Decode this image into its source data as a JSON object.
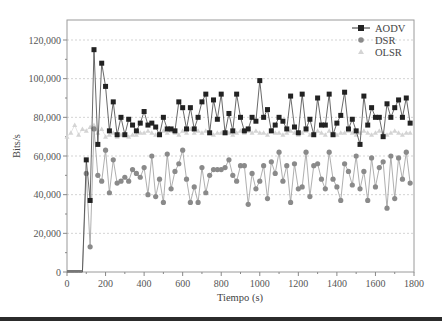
{
  "chart_data": {
    "type": "line",
    "title": "",
    "xlabel": "Tiempo (s)",
    "ylabel": "Bits/s",
    "xlim": [
      0,
      1800
    ],
    "ylim": [
      0,
      130000
    ],
    "x_ticks": [
      0,
      200,
      400,
      600,
      800,
      1000,
      1200,
      1400,
      1600,
      1800
    ],
    "x_tick_labels": [
      "0",
      "200",
      "400",
      "600",
      "800",
      "1000",
      "1200",
      "1400",
      "1600",
      "1800"
    ],
    "y_ticks": [
      0,
      20000,
      40000,
      60000,
      80000,
      100000,
      120000
    ],
    "y_tick_labels": [
      "0",
      "20,000",
      "40,000",
      "60,000",
      "80,000",
      "100,000",
      "120,000"
    ],
    "grid": "horizontal dashed",
    "legend_position": "upper right",
    "series": [
      {
        "name": "AODV",
        "marker": "square",
        "color": "#222222",
        "x": [
          0,
          20,
          40,
          60,
          80,
          100,
          120,
          140,
          160,
          180,
          200,
          220,
          240,
          260,
          280,
          300,
          320,
          340,
          360,
          380,
          400,
          420,
          440,
          460,
          480,
          500,
          520,
          540,
          560,
          580,
          600,
          620,
          640,
          660,
          680,
          700,
          720,
          740,
          760,
          780,
          800,
          820,
          840,
          860,
          880,
          900,
          920,
          940,
          960,
          980,
          1000,
          1020,
          1040,
          1060,
          1080,
          1100,
          1120,
          1140,
          1160,
          1180,
          1200,
          1220,
          1240,
          1260,
          1280,
          1300,
          1320,
          1340,
          1360,
          1380,
          1400,
          1420,
          1440,
          1460,
          1480,
          1500,
          1520,
          1540,
          1560,
          1580,
          1600,
          1620,
          1640,
          1660,
          1680,
          1700,
          1720,
          1740,
          1760,
          1780
        ],
        "values": [
          0,
          0,
          0,
          0,
          0,
          58000,
          37000,
          115000,
          66000,
          108000,
          96000,
          73000,
          88000,
          71000,
          80000,
          71000,
          79000,
          76000,
          73000,
          77000,
          83000,
          76000,
          77000,
          75000,
          71000,
          80000,
          74000,
          74000,
          73000,
          88000,
          85000,
          74000,
          85000,
          74000,
          80000,
          88000,
          92000,
          72000,
          89000,
          79000,
          92000,
          72000,
          82000,
          73000,
          92000,
          80000,
          73000,
          74000,
          80000,
          78000,
          99000,
          80000,
          84000,
          73000,
          76000,
          80000,
          78000,
          74000,
          91000,
          75000,
          72000,
          92000,
          74000,
          79000,
          71000,
          90000,
          76000,
          76000,
          92000,
          71000,
          77000,
          81000,
          93000,
          74000,
          79000,
          73000,
          66000,
          91000,
          76000,
          85000,
          80000,
          80000,
          70000,
          87000,
          80000,
          85000,
          89000,
          80000,
          90000,
          77000
        ]
      },
      {
        "name": "DSR",
        "marker": "circle",
        "color": "#8a8a8a",
        "x": [
          0,
          20,
          40,
          60,
          80,
          100,
          120,
          140,
          160,
          180,
          200,
          220,
          240,
          260,
          280,
          300,
          320,
          340,
          360,
          380,
          400,
          420,
          440,
          460,
          480,
          500,
          520,
          540,
          560,
          580,
          600,
          620,
          640,
          660,
          680,
          700,
          720,
          740,
          760,
          780,
          800,
          820,
          840,
          860,
          880,
          900,
          920,
          940,
          960,
          980,
          1000,
          1020,
          1040,
          1060,
          1080,
          1100,
          1120,
          1140,
          1160,
          1180,
          1200,
          1220,
          1240,
          1260,
          1280,
          1300,
          1320,
          1340,
          1360,
          1380,
          1400,
          1420,
          1440,
          1460,
          1480,
          1500,
          1520,
          1540,
          1560,
          1580,
          1600,
          1620,
          1640,
          1660,
          1680,
          1700,
          1720,
          1740,
          1760,
          1780
        ],
        "values": [
          0,
          0,
          0,
          0,
          0,
          51000,
          13000,
          74000,
          50000,
          47000,
          63000,
          41000,
          58000,
          46000,
          47000,
          49000,
          47000,
          53000,
          51000,
          49000,
          54000,
          40000,
          60000,
          39000,
          48000,
          36000,
          61000,
          43000,
          52000,
          56000,
          63000,
          48000,
          36000,
          44000,
          36000,
          54000,
          41000,
          50000,
          53000,
          53000,
          53000,
          54000,
          58000,
          50000,
          47000,
          55000,
          55000,
          35000,
          51000,
          43000,
          47000,
          55000,
          38000,
          57000,
          51000,
          62000,
          47000,
          55000,
          36000,
          56000,
          43000,
          44000,
          62000,
          39000,
          55000,
          56000,
          48000,
          43000,
          62000,
          48000,
          44000,
          37000,
          56000,
          52000,
          45000,
          60000,
          43000,
          52000,
          37000,
          59000,
          44000,
          54000,
          57000,
          33000,
          60000,
          38000,
          59000,
          48000,
          62000,
          46000
        ]
      },
      {
        "name": "OLSR",
        "marker": "triangle",
        "color": "#d4d4d4",
        "x": [
          0,
          20,
          40,
          60,
          80,
          100,
          120,
          140,
          160,
          180,
          200,
          220,
          240,
          260,
          280,
          300,
          320,
          340,
          360,
          380,
          400,
          420,
          440,
          460,
          480,
          500,
          520,
          540,
          560,
          580,
          600,
          620,
          640,
          660,
          680,
          700,
          720,
          740,
          760,
          780,
          800,
          820,
          840,
          860,
          880,
          900,
          920,
          940,
          960,
          980,
          1000,
          1020,
          1040,
          1060,
          1080,
          1100,
          1120,
          1140,
          1160,
          1180,
          1200,
          1220,
          1240,
          1260,
          1280,
          1300,
          1320,
          1340,
          1360,
          1380,
          1400,
          1420,
          1440,
          1460,
          1480,
          1500,
          1520,
          1540,
          1560,
          1580,
          1600,
          1620,
          1640,
          1660,
          1680,
          1700,
          1720,
          1740,
          1760,
          1780
        ],
        "values": [
          70000,
          72000,
          76000,
          71000,
          74000,
          73000,
          75000,
          76000,
          72000,
          74000,
          70000,
          71000,
          72000,
          70000,
          71000,
          72000,
          70000,
          71000,
          71000,
          72000,
          72000,
          73000,
          72000,
          71000,
          72000,
          73000,
          72000,
          73000,
          72000,
          71000,
          73000,
          72000,
          74000,
          72000,
          73000,
          72000,
          73000,
          72000,
          71000,
          72000,
          72000,
          73000,
          72000,
          71000,
          72000,
          73000,
          72000,
          73000,
          72000,
          73000,
          72000,
          72000,
          71000,
          73000,
          72000,
          72000,
          71000,
          72000,
          73000,
          72000,
          71000,
          72000,
          73000,
          71000,
          72000,
          73000,
          72000,
          71000,
          73000,
          72000,
          71000,
          72000,
          72000,
          73000,
          72000,
          71000,
          72000,
          73000,
          72000,
          71000,
          72000,
          73000,
          72000,
          71000,
          72000,
          73000,
          72000,
          71000,
          72000,
          72000
        ]
      }
    ]
  },
  "legend": {
    "items": [
      {
        "label": "AODV"
      },
      {
        "label": "DSR"
      },
      {
        "label": "OLSR"
      }
    ]
  },
  "axes": {
    "xlabel": "Tiempo (s)",
    "ylabel": "Bits/s"
  }
}
